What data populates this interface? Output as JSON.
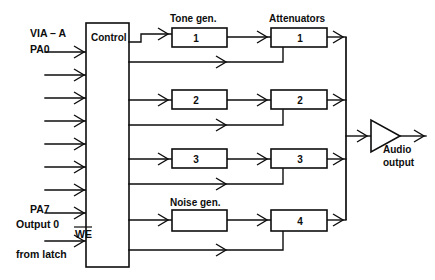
{
  "diagram": {
    "control_block": {
      "label": "Control"
    },
    "input_labels": {
      "bus_name": "VIA – A",
      "first_pin": "PA0",
      "last_pin": "PA7",
      "we_label": "WE",
      "we_source_line1": "Output 0",
      "we_source_line2": "from latch"
    },
    "column_headers": {
      "tone": "Tone gen.",
      "attenuators": "Attenuators",
      "noise": "Noise gen."
    },
    "generators": [
      {
        "name": "tone-gen-1",
        "label": "1"
      },
      {
        "name": "tone-gen-2",
        "label": "2"
      },
      {
        "name": "tone-gen-3",
        "label": "3"
      },
      {
        "name": "noise-gen",
        "label": ""
      }
    ],
    "attenuators": [
      {
        "name": "attenuator-1",
        "label": "1"
      },
      {
        "name": "attenuator-2",
        "label": "2"
      },
      {
        "name": "attenuator-3",
        "label": "3"
      },
      {
        "name": "attenuator-4",
        "label": "4"
      }
    ],
    "output": {
      "label_line1": "Audio",
      "label_line2": "output"
    },
    "colors": {
      "ink": "#0d0d0d",
      "paper": "#ffffff"
    },
    "input_arrow_count": 9
  }
}
